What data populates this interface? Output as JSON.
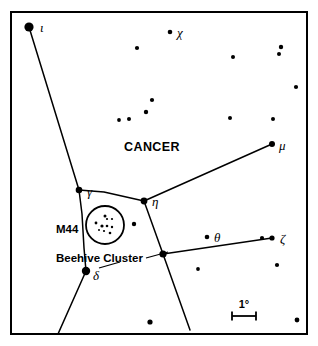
{
  "chart_data": {
    "type": "scatter",
    "title": "",
    "subtitle": "",
    "xlabel": "",
    "ylabel": "",
    "grid": false,
    "legend": "none",
    "xlim": [
      0,
      318
    ],
    "ylim": [
      0,
      346
    ],
    "frame": {
      "x": 11,
      "y": 12,
      "width": 296,
      "height": 322,
      "stroke": "#000000",
      "stroke_width": 2
    },
    "background_color": "#ffffff",
    "ink_color": "#000000",
    "constellation_name": "CANCER",
    "labels": [
      {
        "id": "cancer",
        "text": "CANCER",
        "x": 152,
        "y": 151,
        "anchor": "middle",
        "style": "constellation"
      },
      {
        "id": "m44",
        "text": "M44",
        "x": 56,
        "y": 233,
        "anchor": "start",
        "style": "object"
      },
      {
        "id": "beehive",
        "text": "Beehive Cluster",
        "x": 56,
        "y": 262,
        "anchor": "start",
        "style": "object"
      },
      {
        "id": "scale",
        "text": "1°",
        "x": 244,
        "y": 308,
        "anchor": "middle",
        "style": "scale"
      }
    ],
    "star_labels": [
      {
        "id": "iota",
        "text": "ι",
        "x": 40,
        "y": 32,
        "anchor": "start"
      },
      {
        "id": "chi",
        "text": "χ",
        "x": 177,
        "y": 37,
        "anchor": "start"
      },
      {
        "id": "mu",
        "text": "μ",
        "x": 279,
        "y": 150,
        "anchor": "start"
      },
      {
        "id": "gamma",
        "text": "γ",
        "x": 87,
        "y": 196,
        "anchor": "start"
      },
      {
        "id": "eta",
        "text": "η",
        "x": 152,
        "y": 206,
        "anchor": "start"
      },
      {
        "id": "theta",
        "text": "θ",
        "x": 214,
        "y": 242,
        "anchor": "start"
      },
      {
        "id": "zeta",
        "text": "ζ",
        "x": 280,
        "y": 243,
        "anchor": "start"
      },
      {
        "id": "delta",
        "text": "δ",
        "x": 93,
        "y": 280,
        "anchor": "start"
      }
    ],
    "named_stars": [
      {
        "id": "iota",
        "name": "ι",
        "x": 29,
        "y": 27,
        "r": 4.6
      },
      {
        "id": "chi",
        "name": "χ",
        "x": 170,
        "y": 32,
        "r": 2.3
      },
      {
        "id": "mu",
        "name": "μ",
        "x": 272,
        "y": 144,
        "r": 3.0
      },
      {
        "id": "gamma",
        "name": "γ",
        "x": 79,
        "y": 190,
        "r": 3.3
      },
      {
        "id": "eta",
        "name": "η",
        "x": 144,
        "y": 201,
        "r": 3.4
      },
      {
        "id": "theta",
        "name": "θ",
        "x": 207,
        "y": 237,
        "r": 2.3
      },
      {
        "id": "zeta",
        "name": "ζ",
        "x": 272,
        "y": 238,
        "r": 2.6
      },
      {
        "id": "delta",
        "name": "δ",
        "x": 86,
        "y": 271,
        "r": 4.2
      }
    ],
    "field_stars": [
      {
        "x": 137,
        "y": 48,
        "r": 2.1
      },
      {
        "x": 233,
        "y": 57,
        "r": 2.0
      },
      {
        "x": 281,
        "y": 47,
        "r": 2.2
      },
      {
        "x": 279,
        "y": 54,
        "r": 2.0
      },
      {
        "x": 296,
        "y": 87,
        "r": 2.1
      },
      {
        "x": 152,
        "y": 100,
        "r": 2.1
      },
      {
        "x": 146,
        "y": 112,
        "r": 2.2
      },
      {
        "x": 129,
        "y": 119,
        "r": 2.0
      },
      {
        "x": 119,
        "y": 120,
        "r": 1.9
      },
      {
        "x": 230,
        "y": 118,
        "r": 2.0
      },
      {
        "x": 273,
        "y": 119,
        "r": 2.0
      },
      {
        "x": 134,
        "y": 224,
        "r": 2.2
      },
      {
        "x": 163,
        "y": 254,
        "r": 3.6
      },
      {
        "x": 262,
        "y": 238,
        "r": 2.1
      },
      {
        "x": 277,
        "y": 265,
        "r": 2.1
      },
      {
        "x": 198,
        "y": 269,
        "r": 1.9
      },
      {
        "x": 150,
        "y": 322,
        "r": 2.6
      },
      {
        "x": 297,
        "y": 320,
        "r": 2.4
      }
    ],
    "cluster": {
      "id": "m44",
      "label": "M44",
      "alt_label": "Beehive Cluster",
      "cx": 105,
      "cy": 225,
      "r": 19,
      "stroke_width": 1.8,
      "member_stars": [
        {
          "x": 96,
          "y": 223,
          "r": 1.4
        },
        {
          "x": 105,
          "y": 216,
          "r": 1.5
        },
        {
          "x": 107,
          "y": 219,
          "r": 1.1
        },
        {
          "x": 112,
          "y": 219,
          "r": 1.1
        },
        {
          "x": 102,
          "y": 226,
          "r": 1.6
        },
        {
          "x": 107,
          "y": 226,
          "r": 1.3
        },
        {
          "x": 112,
          "y": 227,
          "r": 1.2
        },
        {
          "x": 104,
          "y": 231,
          "r": 1.1
        },
        {
          "x": 110,
          "y": 233,
          "r": 1.3
        },
        {
          "x": 99,
          "y": 230,
          "r": 1.0
        }
      ]
    },
    "constellation_lines": [
      {
        "id": "iota-gamma",
        "points": [
          [
            29,
            27
          ],
          [
            79,
            190
          ]
        ]
      },
      {
        "id": "gamma-eta",
        "points": [
          [
            79,
            190
          ],
          [
            104,
            192
          ],
          [
            144,
            201
          ]
        ]
      },
      {
        "id": "eta-mu",
        "points": [
          [
            144,
            201
          ],
          [
            272,
            144
          ]
        ]
      },
      {
        "id": "eta-south",
        "points": [
          [
            144,
            201
          ],
          [
            163,
            254
          ],
          [
            190,
            330
          ]
        ]
      },
      {
        "id": "gamma-m44-delta",
        "points": [
          [
            79,
            190
          ],
          [
            82,
            214
          ],
          [
            84,
            248
          ],
          [
            86,
            271
          ]
        ]
      },
      {
        "id": "delta-southwest",
        "points": [
          [
            86,
            271
          ],
          [
            58,
            334
          ]
        ]
      },
      {
        "id": "junction-zeta",
        "points": [
          [
            163,
            254
          ],
          [
            272,
            238
          ]
        ]
      }
    ],
    "leader_lines": [
      {
        "id": "beehive-leader",
        "points": [
          [
            146,
            258
          ],
          [
            168,
            252
          ]
        ]
      },
      {
        "id": "delta-leader",
        "points": [
          [
            99,
            268
          ],
          [
            120,
            262
          ]
        ]
      }
    ],
    "scale_bar": {
      "label": "1°",
      "x1": 232,
      "x2": 256,
      "y": 316,
      "cap_height": 9,
      "stroke_width": 1.8
    }
  }
}
